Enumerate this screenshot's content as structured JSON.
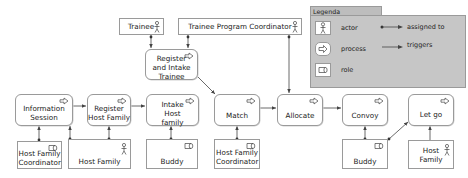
{
  "legend": {
    "title": "Legenda",
    "items": [
      {
        "symbol": "actor-icon",
        "label": "actor"
      },
      {
        "symbol": "process-icon",
        "label": "process"
      },
      {
        "symbol": "role-icon",
        "label": "role"
      }
    ],
    "relations": [
      {
        "symbol": "assigned-to-arrow",
        "label": "assigned to"
      },
      {
        "symbol": "triggers-arrow",
        "label": "triggers"
      }
    ]
  },
  "actors": {
    "trainee": "Trainee",
    "trainee_program_coordinator": "Trainee Program Coordinator",
    "host_family_1": "Host Family",
    "host_family_2": "Host Family"
  },
  "roles": {
    "host_family_coordinator_1": "Host Family Coordinator",
    "buddy_1": "Buddy",
    "host_family_coordinator_2": "Host Family Coordinator",
    "buddy_2": "Buddy"
  },
  "processes": {
    "register_intake_trainee": "Register and Intake Trainee",
    "information_session": "Information Session",
    "register_host_family": "Register Host Family",
    "intake_host_family": "Intake Host family",
    "match": "Match",
    "allocate": "Allocate",
    "convoy": "Convoy",
    "let_go": "Let go"
  },
  "colors": {
    "border": "#9a9a9a",
    "legend_bg": "#c6c6c6",
    "legend_tab": "#bdbdbd",
    "edge": "#444444"
  }
}
